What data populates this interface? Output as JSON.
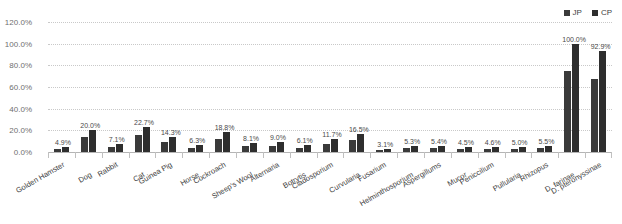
{
  "legend": {
    "position": "top-right",
    "items": [
      {
        "label": "JP",
        "color": "#3a3a3a",
        "icon": "square-swatch"
      },
      {
        "label": "CP",
        "color": "#2e2e2e",
        "icon": "square-swatch"
      }
    ]
  },
  "chart_data": {
    "type": "bar",
    "title": "",
    "xlabel": "",
    "ylabel": "",
    "ylim": [
      0,
      120
    ],
    "grid": true,
    "legend_position": "top-right",
    "ytick_labels": [
      "0.0%",
      "20.0%",
      "40.0%",
      "60.0%",
      "80.0%",
      "100.0%",
      "120.0%"
    ],
    "ytick_values": [
      0,
      20,
      40,
      60,
      80,
      100,
      120
    ],
    "categories": [
      "Golden Hamster",
      "Dog",
      "Rabbit",
      "Cat",
      "Guinea Pig",
      "Horse",
      "Cockroach",
      "Sheep's Wool",
      "Alternaria",
      "Botrytis",
      "Cladosporium",
      "Curvularia",
      "Fusarium",
      "Helminthosporium",
      "Aspergillums",
      "Mucor",
      "Peniccilium",
      "Pullularia",
      "Rhizopus",
      "D. farinae",
      "D. pteronyssinae"
    ],
    "series": [
      {
        "name": "JP",
        "values": [
          2.6,
          13.5,
          4.3,
          16.0,
          9.5,
          3.8,
          12.4,
          5.2,
          5.8,
          3.7,
          7.6,
          10.8,
          1.9,
          3.4,
          3.5,
          2.8,
          2.9,
          3.2,
          3.5,
          74.5,
          67.8
        ]
      },
      {
        "name": "CP",
        "values": [
          4.9,
          20.0,
          7.1,
          22.7,
          14.3,
          6.3,
          18.8,
          8.1,
          9.0,
          6.1,
          11.7,
          16.5,
          3.1,
          5.3,
          5.4,
          4.5,
          4.6,
          5.0,
          5.5,
          100.0,
          92.9
        ]
      }
    ],
    "data_labels": [
      "4.9%",
      "20.0%",
      "7.1%",
      "22.7%",
      "14.3%",
      "6.3%",
      "18.8%",
      "8.1%",
      "9.0%",
      "6.1%",
      "11.7%",
      "16.5%",
      "3.1%",
      "5.3%",
      "5.4%",
      "4.5%",
      "4.6%",
      "5.0%",
      "5.5%",
      "100.0%",
      "92.9%"
    ]
  },
  "colors": {
    "jp": "#3a3a3a",
    "cp": "#2e2e2e",
    "grid": "#c9c9c9",
    "axis": "#b5b5b5",
    "tick_text": "#6f6f6f",
    "label_text": "#4a4a4a"
  }
}
